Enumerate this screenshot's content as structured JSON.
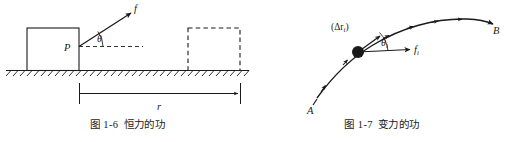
{
  "page": {
    "background": "#ffffff",
    "ink": "#1a1a1a",
    "width": 509,
    "height": 142
  },
  "figures": [
    {
      "id": "figure-constant-force",
      "number": "图 1-6",
      "title": "恒力的功",
      "labels": {
        "force": "f",
        "angle": "θ",
        "point": "P",
        "displacement": "r"
      },
      "elements": {
        "block": "solid-rectangle-initial-position",
        "ghost_block": "dashed-rectangle-final-position",
        "ground": "hatched-ground-line",
        "force_vector": "arrow-from-P-up-right",
        "horizontal_dashed": "dashed-horizontal-reference-line",
        "dimension_line": "displacement-dimension-arrow"
      }
    },
    {
      "id": "figure-variable-force",
      "number": "图 1-7",
      "title": "变力的功",
      "labels": {
        "start_point": "A",
        "end_point": "B",
        "displacement_element": "(Δr",
        "displacement_element_sub": "i",
        "displacement_element_close": ")",
        "angle": "θ",
        "angle_sub": "i",
        "force": "f",
        "force_sub": "i"
      },
      "elements": {
        "path_curve": "curved-trajectory-from-A-to-B",
        "particle": "filled-dot-on-curve",
        "force_vector": "arrow-right-from-particle",
        "tangent_vector": "arrow-along-curve",
        "direction_ticks": "arrow-ticks-along-curve"
      }
    }
  ]
}
